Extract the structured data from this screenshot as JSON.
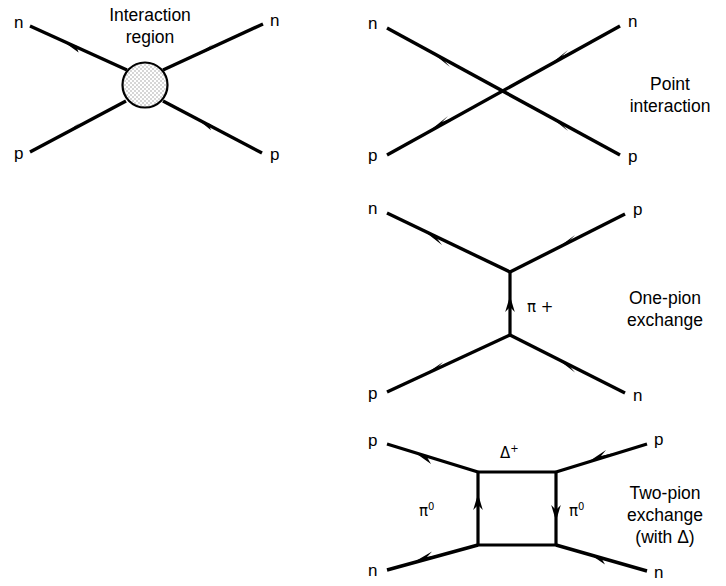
{
  "figure": {
    "background_color": "#ffffff",
    "line_color": "#000000",
    "blob_fill_color": "#f0f0f0"
  },
  "diagrams": [
    {
      "id": "interaction-region",
      "caption": "Interaction\nregion",
      "caption_line1": "Interaction",
      "caption_line2": "region",
      "incoming": [
        {
          "name": "neutron-in",
          "label": "n"
        },
        {
          "name": "proton-in",
          "label": "p"
        }
      ],
      "outgoing": [
        {
          "name": "neutron-out",
          "label": "n"
        },
        {
          "name": "proton-out",
          "label": "p"
        }
      ],
      "blob": {
        "name": "interaction-blob",
        "shape": "stippled-circle"
      }
    },
    {
      "id": "point-interaction",
      "caption_line1": "Point",
      "caption_line2": "interaction",
      "incoming": [
        {
          "name": "neutron-in",
          "label": "n"
        },
        {
          "name": "proton-in",
          "label": "p"
        }
      ],
      "outgoing": [
        {
          "name": "neutron-out",
          "label": "n"
        },
        {
          "name": "proton-out",
          "label": "p"
        }
      ]
    },
    {
      "id": "one-pion-exchange",
      "caption_line1": "One-pion",
      "caption_line2": "exchange",
      "incoming": [
        {
          "name": "neutron-in",
          "label": "n"
        },
        {
          "name": "proton-in",
          "label": "p"
        }
      ],
      "outgoing": [
        {
          "name": "proton-out",
          "label": "p"
        },
        {
          "name": "neutron-out",
          "label": "n"
        }
      ],
      "exchange": {
        "name": "pion-plus-propagator",
        "symbol": "π",
        "charge": "+",
        "label": "π +"
      }
    },
    {
      "id": "two-pion-exchange",
      "caption_line1": "Two-pion",
      "caption_line2": "exchange",
      "caption_line3": "(with Δ)",
      "incoming": [
        {
          "name": "proton-in",
          "label": "p"
        },
        {
          "name": "neutron-in",
          "label": "n"
        }
      ],
      "outgoing": [
        {
          "name": "proton-out",
          "label": "p"
        },
        {
          "name": "neutron-out",
          "label": "n"
        }
      ],
      "internal": {
        "name": "delta-plus-line",
        "symbol": "Δ",
        "charge": "+",
        "label": "Δ+"
      },
      "exchange_left": {
        "name": "pion-zero-left-propagator",
        "symbol": "π",
        "charge": "0",
        "label": "π0"
      },
      "exchange_right": {
        "name": "pion-zero-right-propagator",
        "symbol": "π",
        "charge": "0",
        "label": "π0"
      }
    }
  ]
}
